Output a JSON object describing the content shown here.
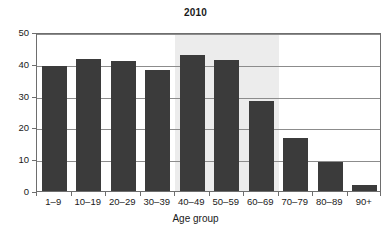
{
  "chart_data": {
    "type": "bar",
    "title": "2010",
    "xlabel": "Age group",
    "ylabel": "",
    "categories": [
      "1–9",
      "10–19",
      "20–29",
      "30–39",
      "40–49",
      "50–59",
      "60–69",
      "70–79",
      "80–89",
      "90+"
    ],
    "values": [
      39.4,
      41.5,
      41.0,
      38.2,
      42.7,
      41.1,
      28.2,
      16.6,
      9.2,
      2.0
    ],
    "ylim": [
      0,
      50
    ],
    "yticks": [
      0,
      10,
      20,
      30,
      40,
      50
    ],
    "ytick_labels": [
      "0",
      "10",
      "20",
      "30",
      "40",
      "50"
    ],
    "grid": "horizontal",
    "legend": "none",
    "annotations": [
      {
        "kind": "shaded-band",
        "from_category": "40–49",
        "to_category": "60–69",
        "color": "#ececec"
      }
    ],
    "colors": {
      "bar": "#3b3b3b",
      "gridline": "#8c8c8c",
      "axis": "#6e6e6e",
      "band": "#ececec",
      "text": "#1a1a1a",
      "background": "#ffffff"
    }
  }
}
